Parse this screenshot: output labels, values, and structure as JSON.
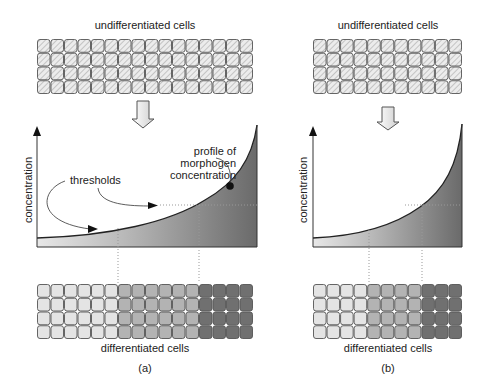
{
  "panels": [
    {
      "id": "a",
      "caption": "(a)",
      "top_label": "undifferentiated cells",
      "bottom_label": "differentiated cells",
      "y_axis_label": "concentration",
      "annotations": {
        "thresholds": "thresholds",
        "profile_line1": "profile of",
        "profile_line2": "morphogen",
        "profile_line3": "concentration"
      },
      "grid": {
        "columns": 16,
        "rows": 4
      },
      "differentiated_zones": [
        {
          "name": "low",
          "columns": 6,
          "color": "#e4e4e4"
        },
        {
          "name": "mid",
          "columns": 6,
          "color": "#b3b3b3"
        },
        {
          "name": "high",
          "columns": 4,
          "color": "#707070"
        }
      ]
    },
    {
      "id": "b",
      "caption": "(b)",
      "top_label": "undifferentiated cells",
      "bottom_label": "differentiated cells",
      "y_axis_label": "concentration",
      "grid": {
        "columns": 11,
        "rows": 4
      },
      "differentiated_zones": [
        {
          "name": "low",
          "columns": 4,
          "color": "#e4e4e4"
        },
        {
          "name": "mid",
          "columns": 4,
          "color": "#b3b3b3"
        },
        {
          "name": "high",
          "columns": 3,
          "color": "#707070"
        }
      ]
    }
  ],
  "colors": {
    "cell_border": "#555555",
    "hatch_fill": "#e8e8e8",
    "curve": "#222222"
  }
}
